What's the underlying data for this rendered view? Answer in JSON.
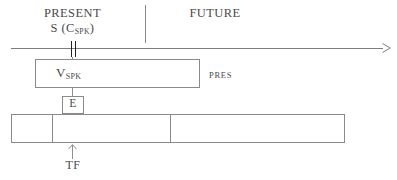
{
  "figure": {
    "timeline": {
      "present_label": "PRESENT",
      "future_label": "FUTURE",
      "speech_marker_label": "S (C",
      "speech_marker_sub": "SPK",
      "speech_marker_close": ")",
      "axis_icon": "right-arrow-icon",
      "present_marker_icon": "double-bar-marker-icon"
    },
    "pres_box": {
      "inner_label": "V",
      "inner_label_sub": "SPK",
      "side_label": "PRES"
    },
    "event_box": {
      "label": "E"
    },
    "situation_bar": {
      "segments": [
        "",
        "",
        ""
      ],
      "pointer_label": "TF",
      "pointer_icon": "up-arrow-icon"
    },
    "colors": {
      "stroke": "#8a8a8a",
      "marker": "#1f1f1f",
      "text": "#4a4a4a",
      "background": "#ffffff"
    }
  }
}
